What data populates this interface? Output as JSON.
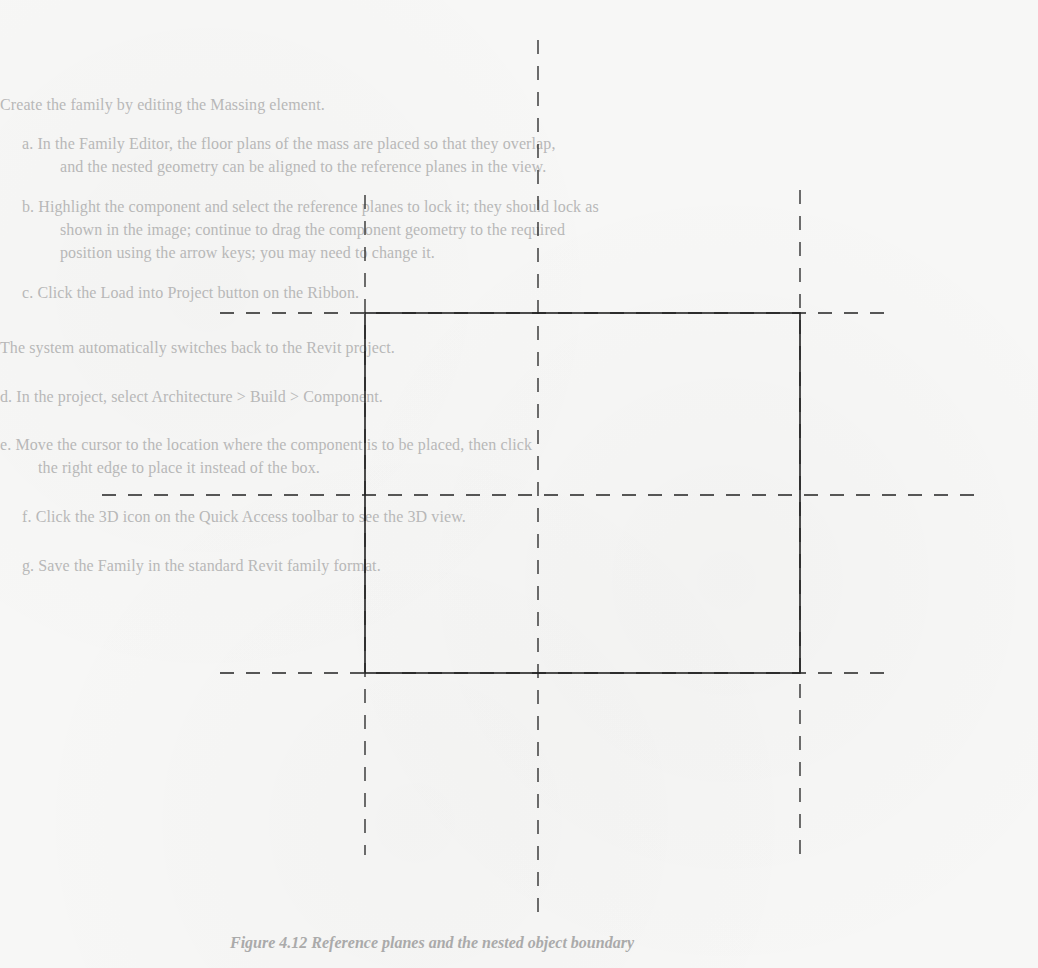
{
  "document": {
    "lines": [
      {
        "id": "l1",
        "text": "Create the family by editing the Massing element.",
        "x": 0,
        "y": 96
      },
      {
        "id": "l2",
        "text": "a. In the Family Editor, the floor plans of the mass are placed so that they overlap,",
        "x": 22,
        "y": 135
      },
      {
        "id": "l3",
        "text": "and the nested geometry can be aligned to the reference planes in the view.",
        "x": 60,
        "y": 158
      },
      {
        "id": "l4",
        "text": "b. Highlight the component and select the reference planes to lock it; they should lock as",
        "x": 22,
        "y": 198
      },
      {
        "id": "l5",
        "text": "shown in the image; continue to drag the component geometry to the required",
        "x": 60,
        "y": 221
      },
      {
        "id": "l6",
        "text": "position using the arrow keys; you may need to change it.",
        "x": 60,
        "y": 244
      },
      {
        "id": "l7",
        "text": "c. Click the Load into Project button on the Ribbon.",
        "x": 22,
        "y": 284
      },
      {
        "id": "l8",
        "text": "The system automatically switches back to the Revit project.",
        "x": 0,
        "y": 339
      },
      {
        "id": "l9",
        "text": "d. In the project, select Architecture > Build > Component.",
        "x": 0,
        "y": 388
      },
      {
        "id": "l10",
        "text": "e. Move the cursor to the location where the component is to be placed, then click",
        "x": 0,
        "y": 436
      },
      {
        "id": "l11",
        "text": "the right edge to place it instead of the box.",
        "x": 38,
        "y": 459
      },
      {
        "id": "l12",
        "text": "f. Click the 3D icon on the Quick Access toolbar to see the 3D view.",
        "x": 22,
        "y": 508
      },
      {
        "id": "l13",
        "text": "g. Save the Family in the standard Revit family format.",
        "x": 22,
        "y": 557
      }
    ],
    "caption": "Figure 4.12 Reference planes and the nested object boundary"
  },
  "diagram": {
    "stroke": "#222222",
    "rect": {
      "x1": 365,
      "y1": 313,
      "x2": 800,
      "y2": 673
    },
    "dashed_lines": [
      {
        "name": "center-vertical-reference-plane",
        "x1": 538,
        "y1": 40,
        "x2": 538,
        "y2": 915
      },
      {
        "name": "left-vertical-reference-plane",
        "x1": 365,
        "y1": 195,
        "x2": 365,
        "y2": 855
      },
      {
        "name": "right-vertical-reference-plane",
        "x1": 800,
        "y1": 190,
        "x2": 800,
        "y2": 865
      },
      {
        "name": "top-horizontal-reference-plane",
        "x1": 220,
        "y1": 313,
        "x2": 890,
        "y2": 313
      },
      {
        "name": "center-horizontal-reference-plane",
        "x1": 102,
        "y1": 495,
        "x2": 975,
        "y2": 495
      },
      {
        "name": "bottom-horizontal-reference-plane",
        "x1": 220,
        "y1": 673,
        "x2": 890,
        "y2": 673
      }
    ]
  }
}
